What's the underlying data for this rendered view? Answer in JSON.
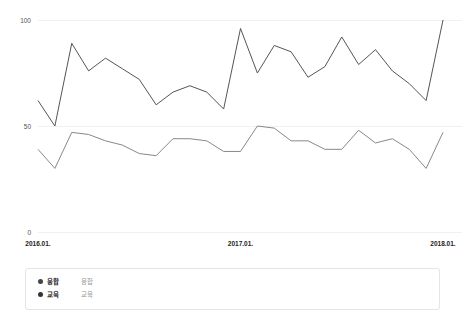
{
  "chart_data": {
    "type": "line",
    "title": "",
    "xlabel": "",
    "ylabel": "",
    "ylim": [
      0,
      100
    ],
    "yticks": [
      0,
      50,
      100
    ],
    "ytick_labels": [
      "0",
      "50",
      "100"
    ],
    "grid": true,
    "legend_position": "bottom",
    "x": [
      "2016.01.",
      "2016.02.",
      "2016.03.",
      "2016.04.",
      "2016.05.",
      "2016.06.",
      "2016.07.",
      "2016.08.",
      "2016.09.",
      "2016.10.",
      "2016.11.",
      "2016.12.",
      "2017.01.",
      "2017.02.",
      "2017.03.",
      "2017.04.",
      "2017.05.",
      "2017.06.",
      "2017.07.",
      "2017.08.",
      "2017.09.",
      "2017.10.",
      "2017.11.",
      "2017.12.",
      "2018.01."
    ],
    "xtick_labels": [
      "2016.01.",
      "2017.01.",
      "2018.01."
    ],
    "xtick_indices": [
      0,
      12,
      24
    ],
    "series": [
      {
        "name": "융합",
        "color": "#555555",
        "values": [
          62,
          50,
          89,
          76,
          82,
          77,
          72,
          60,
          66,
          69,
          66,
          58,
          96,
          75,
          88,
          85,
          73,
          78,
          92,
          79,
          86,
          76,
          70,
          62,
          100
        ]
      },
      {
        "name": "교육",
        "color": "#888888",
        "values": [
          39,
          30,
          47,
          46,
          43,
          41,
          37,
          36,
          44,
          44,
          43,
          38,
          38,
          50,
          49,
          43,
          43,
          39,
          39,
          48,
          42,
          44,
          39,
          30,
          47
        ]
      }
    ]
  },
  "legend": {
    "items": [
      {
        "label": "융합",
        "value": "융합",
        "color": "#444444"
      },
      {
        "label": "교육",
        "value": "교육",
        "color": "#333333"
      }
    ]
  }
}
